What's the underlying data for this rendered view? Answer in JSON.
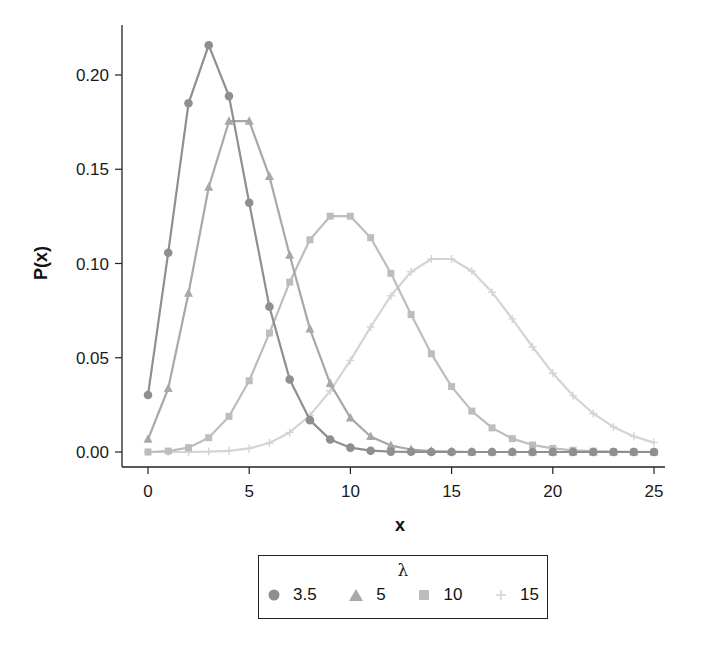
{
  "chart_data": {
    "type": "line",
    "title": "",
    "xlabel": "x",
    "ylabel": "P(x)",
    "xlim": [
      -0.8,
      25.8
    ],
    "ylim": [
      -0.008,
      0.225
    ],
    "xticks": [
      0,
      5,
      10,
      15,
      20,
      25
    ],
    "xtick_labels": [
      "0",
      "5",
      "10",
      "15",
      "20",
      "25"
    ],
    "yticks": [
      0.0,
      0.05,
      0.1,
      0.15,
      0.2
    ],
    "ytick_labels": [
      "0.00",
      "0.05",
      "0.10",
      "0.15",
      "0.20"
    ],
    "grid": false,
    "legend_position": "bottom",
    "legend_title": "λ",
    "x": [
      0,
      1,
      2,
      3,
      4,
      5,
      6,
      7,
      8,
      9,
      10,
      11,
      12,
      13,
      14,
      15,
      16,
      17,
      18,
      19,
      20,
      21,
      22,
      23,
      24,
      25
    ],
    "series": [
      {
        "name": "3.5",
        "marker": "circle",
        "color": "#8f8f8f",
        "values": [
          0.0302,
          0.1057,
          0.185,
          0.2158,
          0.1888,
          0.1322,
          0.0771,
          0.0385,
          0.0169,
          0.0066,
          0.0023,
          0.0007,
          0.0002,
          0.0001,
          0,
          0,
          0,
          0,
          0,
          0,
          0,
          0,
          0,
          0,
          0,
          0
        ]
      },
      {
        "name": "5",
        "marker": "triangle",
        "color": "#a8a8a8",
        "values": [
          0.0067,
          0.0337,
          0.0842,
          0.1404,
          0.1755,
          0.1755,
          0.1462,
          0.1044,
          0.0653,
          0.0363,
          0.0181,
          0.0082,
          0.0034,
          0.0013,
          0.0005,
          0.0002,
          0,
          0,
          0,
          0,
          0,
          0,
          0,
          0,
          0,
          0
        ]
      },
      {
        "name": "10",
        "marker": "square",
        "color": "#bdbdbd",
        "values": [
          0.0,
          0.0005,
          0.0023,
          0.0076,
          0.0189,
          0.0378,
          0.0631,
          0.0901,
          0.1126,
          0.1251,
          0.1251,
          0.1137,
          0.0948,
          0.0729,
          0.0521,
          0.0347,
          0.0217,
          0.0128,
          0.0071,
          0.0037,
          0.0019,
          0.0009,
          0.0004,
          0.0002,
          0.0001,
          0.0
        ]
      },
      {
        "name": "15",
        "marker": "plus",
        "color": "#d4d4d4",
        "values": [
          0.0,
          0.0,
          0.0,
          0.0002,
          0.0006,
          0.0019,
          0.0048,
          0.0104,
          0.0194,
          0.0324,
          0.0486,
          0.0663,
          0.0829,
          0.0956,
          0.1024,
          0.1024,
          0.096,
          0.0847,
          0.0706,
          0.0557,
          0.0418,
          0.0299,
          0.0204,
          0.0133,
          0.0083,
          0.005
        ]
      }
    ]
  },
  "axes": {
    "xlabel": "x",
    "ylabel": "P(x)"
  },
  "legend": {
    "title": "λ",
    "items": [
      {
        "label": "3.5",
        "marker": "circle-icon"
      },
      {
        "label": "5",
        "marker": "triangle-icon"
      },
      {
        "label": "10",
        "marker": "square-icon"
      },
      {
        "label": "15",
        "marker": "plus-icon"
      }
    ]
  }
}
